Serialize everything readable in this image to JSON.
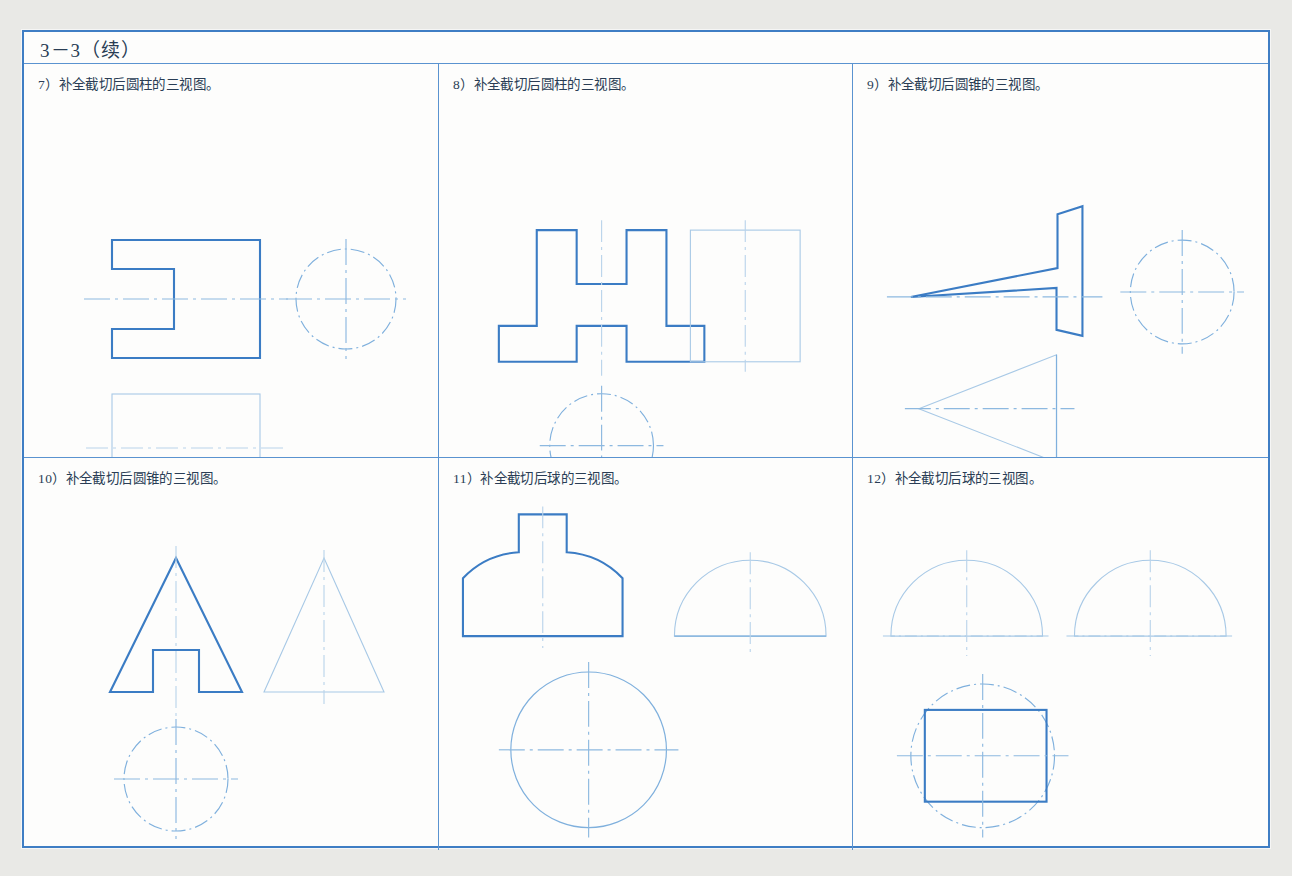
{
  "page": {
    "title": "3－3（续）",
    "background_color": "#e9e9e6",
    "sheet_color": "#fdfdfc",
    "line_color": "#3b7cc4",
    "thin_line_color": "#7fb0dd"
  },
  "exercises": [
    {
      "number": "7）",
      "label": "7）补全截切后圆柱的三视图。",
      "solid": "圆柱",
      "views": [
        "主视图：带左侧缺口的矩形",
        "左视图：点画线圆"
      ]
    },
    {
      "number": "8）",
      "label": "8）补全截切后圆柱的三视图。",
      "solid": "圆柱",
      "views": [
        "主视图：上部开槽、下部凸台的对称轮廓",
        "左视图：细线矩形",
        "俯视图：点画线圆"
      ]
    },
    {
      "number": "9）",
      "label": "9）补全截切后圆锥的三视图。",
      "solid": "圆锥",
      "views": [
        "主视图：带台阶切口的锥形轮廓",
        "左视图：点画线圆",
        "俯视图：向左的三角形"
      ]
    },
    {
      "number": "10）",
      "label": "10）补全截切后圆锥的三视图。",
      "solid": "圆锥",
      "views": [
        "主视图：底部开矩形槽的三角形",
        "左视图：三角形",
        "俯视图：点画线圆"
      ]
    },
    {
      "number": "11）",
      "label": "11）补全截切后球的三视图。",
      "solid": "球",
      "views": [
        "主视图：顶部开槽的半圆",
        "左视图：半圆",
        "俯视图：圆"
      ]
    },
    {
      "number": "12）",
      "label": "12）补全截切后球的三视图。",
      "solid": "球",
      "views": [
        "主视图：半圆",
        "左视图：半圆",
        "俯视图：圆内接矩形"
      ]
    }
  ]
}
